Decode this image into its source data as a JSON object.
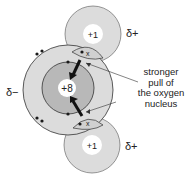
{
  "diagram": {
    "oxygen": {
      "nucleus_label": "+8",
      "partial_charge": "δ−"
    },
    "hydrogen_top": {
      "nucleus_label": "+1",
      "partial_charge": "δ+"
    },
    "hydrogen_bottom": {
      "nucleus_label": "+1",
      "partial_charge": "δ+"
    },
    "bond_electron_markers": [
      "•",
      "x"
    ],
    "annotation": {
      "lines": [
        "stronger",
        "pull of",
        "the oxygen",
        "nucleus"
      ]
    },
    "colors": {
      "outer_shell": "#dcdcdc",
      "inner_shell": "#b8b8b8",
      "nucleus": "#ffffff",
      "stroke": "#333333",
      "electron": "#1a1a1a"
    }
  }
}
